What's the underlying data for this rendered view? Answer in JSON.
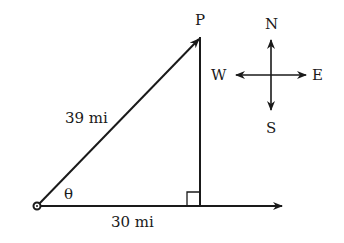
{
  "diagram": {
    "point_label": "P",
    "hypotenuse_label": "39 mi",
    "base_label": "30 mi",
    "angle_label": "θ",
    "compass": {
      "north": "N",
      "south": "S",
      "east": "E",
      "west": "W"
    },
    "line_color": "#1a1a1a"
  }
}
